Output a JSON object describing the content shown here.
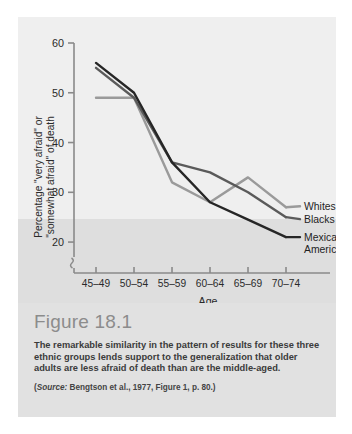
{
  "figure": {
    "heading": "Figure 18.1",
    "body": "The remarkable similarity in the pattern of results for these three ethnic groups lends support to the generalization that older adults are less afraid of death than are the middle-aged.",
    "source_word": "Source:",
    "source_rest": " Bengtson et al., 1977, Figure 1, p. 80.",
    "source_open": "(",
    "source_close": ")"
  },
  "chart_data": {
    "type": "line",
    "title": "",
    "xlabel": "Age",
    "ylabel": "Percentage \"very afraid\" or \"somewhat afraid\" of death",
    "ylabel_line1": "Percentage \"very afraid\" or",
    "ylabel_line2": "\"somewhat afraid\" of death",
    "categories": [
      "45–49",
      "50–54",
      "55–59",
      "60–64",
      "65–69",
      "70–74"
    ],
    "yticks": [
      20,
      30,
      40,
      50,
      60
    ],
    "ylim": [
      17,
      60
    ],
    "grid": false,
    "axis_break": true,
    "legend_position": "right-inline",
    "series": [
      {
        "name": "Whites",
        "color": "#9a9a9a",
        "values": [
          49,
          49,
          32,
          28,
          33,
          27
        ]
      },
      {
        "name": "Blacks",
        "color": "#5a5a5a",
        "values": [
          55,
          49,
          36,
          34,
          30,
          25
        ]
      },
      {
        "name": "Mexican Americans",
        "color": "#262626",
        "values": [
          56,
          50,
          36,
          28,
          24.5,
          21
        ]
      }
    ],
    "legend_labels": [
      "Whites",
      "Blacks",
      "Mexican",
      "Americans"
    ]
  },
  "colors": {
    "panel": "#e7e7e7",
    "chart_bg": "#efefef",
    "lower_band": "#dedede",
    "caption_bg": "#e1e1e1",
    "axis": "#8a8a8a",
    "text": "#2a2a2a"
  }
}
